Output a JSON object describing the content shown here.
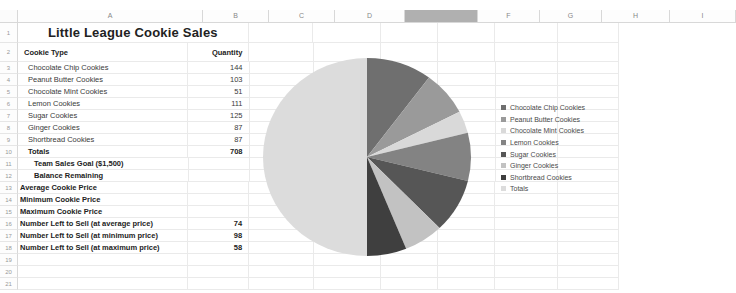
{
  "app": {
    "type": "spreadsheet",
    "selected_column": "E"
  },
  "columns": [
    "A",
    "B",
    "C",
    "D",
    "E",
    "F",
    "G",
    "H",
    "I"
  ],
  "rows": [
    "1",
    "2",
    "3",
    "4",
    "5",
    "6",
    "7",
    "8",
    "9",
    "10",
    "11",
    "12",
    "13",
    "14",
    "15",
    "16",
    "17",
    "18",
    "19",
    "20",
    "21"
  ],
  "sheet": {
    "title": "Little League Cookie Sales",
    "headers": {
      "cookie_type": "Cookie Type",
      "quantity": "Quantity"
    },
    "items": [
      {
        "label": "Chocolate Chip Cookies",
        "qty": "144"
      },
      {
        "label": "Peanut Butter Cookies",
        "qty": "103"
      },
      {
        "label": "Chocolate Mint Cookies",
        "qty": "51"
      },
      {
        "label": "Lemon Cookies",
        "qty": "111"
      },
      {
        "label": "Sugar Cookies",
        "qty": "125"
      },
      {
        "label": "Ginger Cookies",
        "qty": "87"
      },
      {
        "label": "Shortbread Cookies",
        "qty": "87"
      }
    ],
    "totals": {
      "label": "Totals",
      "qty": "708"
    },
    "summary": [
      {
        "label": "Team Sales Goal ($1,500)",
        "value": ""
      },
      {
        "label": "Balance Remaining",
        "value": ""
      },
      {
        "label": "Average Cookie Price",
        "value": ""
      },
      {
        "label": "Minimum Cookie Price",
        "value": ""
      },
      {
        "label": "Maximum Cookie Price",
        "value": ""
      },
      {
        "label": "Number Left to Sell (at average price)",
        "value": "74"
      },
      {
        "label": "Number Left to Sell (at minimum price)",
        "value": "98"
      },
      {
        "label": "Number Left to Sell (at maximum price)",
        "value": "58"
      }
    ]
  },
  "chart_data": {
    "type": "pie",
    "title": "",
    "legend_position": "right",
    "categories": [
      "Chocolate Chip Cookies",
      "Peanut Butter Cookies",
      "Chocolate Mint Cookies",
      "Lemon Cookies",
      "Sugar Cookies",
      "Ginger Cookies",
      "Shortbread Cookies",
      "Totals"
    ],
    "values": [
      144,
      103,
      51,
      111,
      125,
      87,
      87,
      708
    ],
    "colors": [
      "#6f6f6f",
      "#9a9a9a",
      "#d9d9d9",
      "#838383",
      "#565656",
      "#c2c2c2",
      "#3f3f3f",
      "#dcdcdc"
    ],
    "total": 1416,
    "start_angle_deg": 0,
    "direction": "clockwise"
  }
}
